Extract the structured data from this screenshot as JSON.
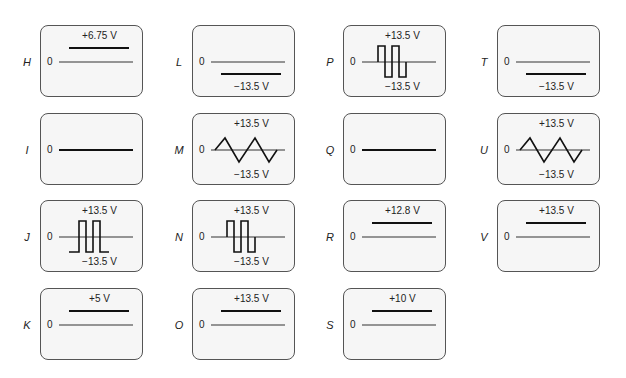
{
  "panels": [
    {
      "id": "H",
      "letter": "H",
      "zero": "0",
      "top_label": "+6.75 V",
      "bottom_label": "",
      "type": "dc_pos"
    },
    {
      "id": "L",
      "letter": "L",
      "zero": "0",
      "top_label": "",
      "bottom_label": "−13.5 V",
      "type": "dc_neg"
    },
    {
      "id": "P",
      "letter": "P",
      "zero": "0",
      "top_label": "+13.5 V",
      "bottom_label": "−13.5 V",
      "type": "square_bipolar"
    },
    {
      "id": "T",
      "letter": "T",
      "zero": "0",
      "top_label": "",
      "bottom_label": "−13.5 V",
      "type": "dc_neg"
    },
    {
      "id": "I",
      "letter": "I",
      "zero": "0",
      "top_label": "",
      "bottom_label": "",
      "type": "zero"
    },
    {
      "id": "M",
      "letter": "M",
      "zero": "0",
      "top_label": "+13.5 V",
      "bottom_label": "−13.5 V",
      "type": "triangle"
    },
    {
      "id": "Q",
      "letter": "Q",
      "zero": "0",
      "top_label": "",
      "bottom_label": "",
      "type": "zero"
    },
    {
      "id": "U",
      "letter": "U",
      "zero": "0",
      "top_label": "+13.5 V",
      "bottom_label": "−13.5 V",
      "type": "triangle"
    },
    {
      "id": "J",
      "letter": "J",
      "zero": "0",
      "top_label": "+13.5 V",
      "bottom_label": "−13.5 V",
      "type": "square_neg_base"
    },
    {
      "id": "N",
      "letter": "N",
      "zero": "0",
      "top_label": "+13.5 V",
      "bottom_label": "−13.5 V",
      "type": "square_bipolar"
    },
    {
      "id": "R",
      "letter": "R",
      "zero": "0",
      "top_label": "+12.8 V",
      "bottom_label": "",
      "type": "dc_pos"
    },
    {
      "id": "V",
      "letter": "V",
      "zero": "0",
      "top_label": "+13.5 V",
      "bottom_label": "",
      "type": "dc_pos"
    },
    {
      "id": "K",
      "letter": "K",
      "zero": "0",
      "top_label": "+5 V",
      "bottom_label": "",
      "type": "dc_pos"
    },
    {
      "id": "O",
      "letter": "O",
      "zero": "0",
      "top_label": "+13.5 V",
      "bottom_label": "",
      "type": "dc_pos"
    },
    {
      "id": "S",
      "letter": "S",
      "zero": "0",
      "top_label": "+10 V",
      "bottom_label": "",
      "type": "dc_pos"
    }
  ],
  "layout": {
    "columns_x": [
      12,
      164,
      315,
      469
    ],
    "rows_y": [
      25,
      113,
      200,
      288
    ],
    "order": [
      [
        "H",
        "L",
        "P",
        "T"
      ],
      [
        "I",
        "M",
        "Q",
        "U"
      ],
      [
        "J",
        "N",
        "R",
        "V"
      ],
      [
        "K",
        "O",
        "S"
      ]
    ]
  },
  "colors": {
    "box_border": "#555555",
    "box_fill": "#f6f6f6",
    "trace": "#111111",
    "axis": "#333333"
  }
}
